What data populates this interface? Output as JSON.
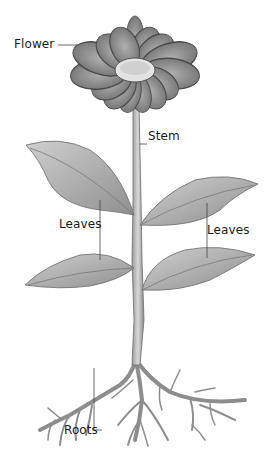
{
  "diagram": {
    "labels": {
      "flower": "Flower",
      "stem": "Stem",
      "leaves_left": "Leaves",
      "leaves_right": "Leaves",
      "roots": "Roots"
    },
    "colors": {
      "background": "#ffffff",
      "outline": "#555555",
      "leaf_fill": "#a9a9a9",
      "petal_fill": "#8a8a8a",
      "center_fill": "#e6e6e6",
      "leader_line": "#444444",
      "text": "#1a1a1a"
    }
  }
}
